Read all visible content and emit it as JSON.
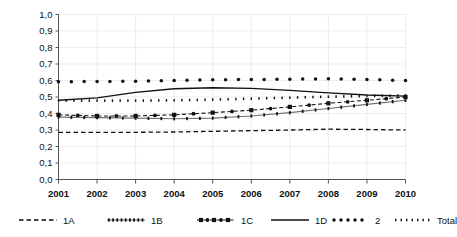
{
  "chart_data": {
    "type": "line",
    "title": "",
    "xlabel": "",
    "ylabel": "",
    "categories": [
      "2001",
      "2002",
      "2003",
      "2004",
      "2005",
      "2006",
      "2007",
      "2008",
      "2009",
      "2010"
    ],
    "x": [
      2001,
      2002,
      2003,
      2004,
      2005,
      2006,
      2007,
      2008,
      2009,
      2010
    ],
    "ylim": [
      0.0,
      1.0
    ],
    "ytick_labels": [
      "0,0",
      "0,1",
      "0,2",
      "0,3",
      "0,4",
      "0,5",
      "0,6",
      "0,7",
      "0,8",
      "0,9",
      "1,0"
    ],
    "ytick_values": [
      0.0,
      0.1,
      0.2,
      0.3,
      0.4,
      0.5,
      0.6,
      0.7,
      0.8,
      0.9,
      1.0
    ],
    "grid": true,
    "legend_position": "bottom",
    "series": [
      {
        "name": "1A",
        "style": "dashed",
        "marker": "none",
        "values": [
          0.285,
          0.285,
          0.286,
          0.288,
          0.292,
          0.296,
          0.3,
          0.305,
          0.303,
          0.3
        ]
      },
      {
        "name": "1B",
        "style": "fine-dotted-line",
        "marker": "tick",
        "values": [
          0.378,
          0.375,
          0.372,
          0.368,
          0.372,
          0.385,
          0.405,
          0.43,
          0.455,
          0.48
        ]
      },
      {
        "name": "1C",
        "style": "dash-dot",
        "marker": "square",
        "values": [
          0.392,
          0.385,
          0.385,
          0.392,
          0.405,
          0.42,
          0.44,
          0.462,
          0.48,
          0.5
        ]
      },
      {
        "name": "1D",
        "style": "solid",
        "marker": "none",
        "values": [
          0.48,
          0.495,
          0.528,
          0.55,
          0.556,
          0.552,
          0.54,
          0.525,
          0.512,
          0.505
        ]
      },
      {
        "name": "2",
        "style": "round-dots",
        "marker": "dot",
        "values": [
          0.592,
          0.594,
          0.596,
          0.6,
          0.604,
          0.606,
          0.608,
          0.61,
          0.606,
          0.6
        ]
      },
      {
        "name": "Total",
        "style": "small-dots",
        "marker": "smalldot",
        "values": [
          0.478,
          0.478,
          0.478,
          0.48,
          0.484,
          0.49,
          0.496,
          0.502,
          0.506,
          0.51
        ]
      }
    ]
  },
  "legend": {
    "items": [
      {
        "label": "1A",
        "sample": "dashed-line-sample"
      },
      {
        "label": "1B",
        "sample": "fine-dotted-line-sample"
      },
      {
        "label": "1C",
        "sample": "dash-dot-square-sample"
      },
      {
        "label": "1D",
        "sample": "solid-line-sample"
      },
      {
        "label": "2",
        "sample": "round-dots-sample"
      },
      {
        "label": "Total",
        "sample": "small-dots-sample"
      }
    ]
  },
  "colors": {
    "ink": "#111111",
    "grid": "#ededed",
    "axis": "#555555",
    "background": "#ffffff"
  }
}
